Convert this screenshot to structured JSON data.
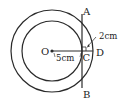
{
  "diagram": {
    "type": "concentric-circles-with-chord",
    "center_label": "O",
    "points": {
      "A": "A",
      "B": "B",
      "C": "C",
      "D": "D"
    },
    "measurements": {
      "OC": "5cm",
      "CD": "2cm"
    },
    "colors": {
      "stroke": "#2a2a2a",
      "background": "#ffffff"
    }
  }
}
